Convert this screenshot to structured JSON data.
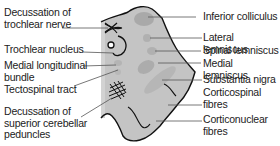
{
  "diagram": {
    "colors": {
      "section_fill": "#c4c4c4",
      "section_outline": "#111111",
      "shading": "#a8a8a8",
      "leader_line": "#444444",
      "text": "#222222"
    },
    "labels_left": [
      {
        "id": "decussation-trochlear",
        "text": "Decussation of\ntrochlear nerve"
      },
      {
        "id": "trochlear-nucleus",
        "text": "Trochlear nucleus"
      },
      {
        "id": "mlf",
        "text": "Medial longitudinal\nbundle"
      },
      {
        "id": "tectospinal",
        "text": "Tectospinal tract"
      },
      {
        "id": "decussation-scp",
        "text": "Decussation of\nsuperior cerebellar\npeduncles"
      }
    ],
    "labels_right": [
      {
        "id": "inferior-colliculus",
        "text": "Inferior colliculus"
      },
      {
        "id": "lateral-lemniscus",
        "text": "Lateral lemniscus"
      },
      {
        "id": "spinal-lemniscus",
        "text": "Spinal lemniscus"
      },
      {
        "id": "medial-lemniscus",
        "text": "Medial lemniscus"
      },
      {
        "id": "substantia-nigra",
        "text": "Substantia nigra"
      },
      {
        "id": "corticospinal",
        "text": "Corticospinal\nfibres"
      },
      {
        "id": "corticonuclear",
        "text": "Corticonuclear\nfibres"
      }
    ]
  }
}
